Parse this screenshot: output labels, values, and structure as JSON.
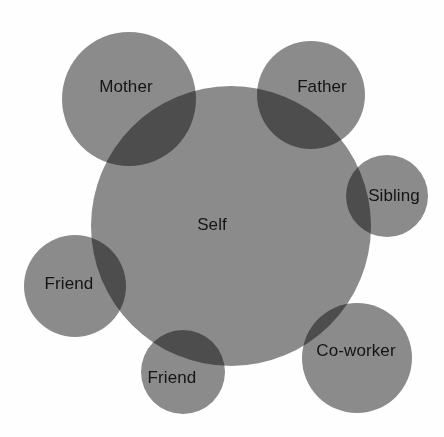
{
  "diagram": {
    "type": "venn",
    "background_color": "#fefefe",
    "circle_fill": "#8c8c8c",
    "overlap_color": "#6e6e6e",
    "label_color": "#141414",
    "label_font_size": 17,
    "canvas": {
      "width": 444,
      "height": 437
    },
    "nodes": [
      {
        "id": "self",
        "label": "Self",
        "cx": 231,
        "cy": 226,
        "r": 140,
        "label_x": 212,
        "label_y": 226,
        "role": "center"
      },
      {
        "id": "mother",
        "label": "Mother",
        "cx": 129,
        "cy": 99,
        "r": 67,
        "label_x": 126,
        "label_y": 88,
        "role": "satellite"
      },
      {
        "id": "father",
        "label": "Father",
        "cx": 311,
        "cy": 95,
        "r": 54,
        "label_x": 322,
        "label_y": 88,
        "role": "satellite"
      },
      {
        "id": "sibling",
        "label": "Sibling",
        "cx": 387,
        "cy": 196,
        "r": 41,
        "label_x": 394,
        "label_y": 197,
        "role": "satellite"
      },
      {
        "id": "friend-left",
        "label": "Friend",
        "cx": 75,
        "cy": 286,
        "r": 51,
        "label_x": 69,
        "label_y": 285,
        "role": "satellite"
      },
      {
        "id": "friend-bottom",
        "label": "Friend",
        "cx": 183,
        "cy": 372,
        "r": 42,
        "label_x": 172,
        "label_y": 379,
        "role": "satellite"
      },
      {
        "id": "co-worker",
        "label": "Co-worker",
        "cx": 357,
        "cy": 358,
        "r": 55,
        "label_x": 356,
        "label_y": 352,
        "role": "satellite"
      }
    ]
  }
}
